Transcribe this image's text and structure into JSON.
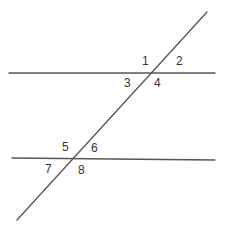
{
  "diagram": {
    "type": "parallel-lines-transversal",
    "line_color": "#555555",
    "label_color": "#333333",
    "lines": [
      {
        "name": "parallel-line-top",
        "x1": 9,
        "y1": 73,
        "x2": 215,
        "y2": 73
      },
      {
        "name": "parallel-line-bottom",
        "x1": 12,
        "y1": 158,
        "x2": 215,
        "y2": 160
      },
      {
        "name": "transversal",
        "x1": 207,
        "y1": 12,
        "x2": 17,
        "y2": 220
      }
    ],
    "angle_labels": [
      {
        "text": "1",
        "x": 142,
        "y": 65
      },
      {
        "text": "2",
        "x": 176,
        "y": 65
      },
      {
        "text": "3",
        "x": 124,
        "y": 87
      },
      {
        "text": "4",
        "x": 154,
        "y": 87
      },
      {
        "text": "5",
        "x": 62,
        "y": 151
      },
      {
        "text": "6",
        "x": 91,
        "y": 152
      },
      {
        "text": "7",
        "x": 45,
        "y": 173
      },
      {
        "text": "8",
        "x": 78,
        "y": 174
      }
    ]
  }
}
